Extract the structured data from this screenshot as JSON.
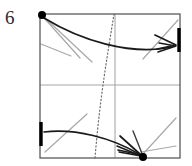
{
  "diagram": {
    "type": "origami-folding-step",
    "step_label": "6",
    "colors": {
      "paper_edge": "#5a5a5a",
      "crease_line": "#a8a8a8",
      "fold_arrow": "#1a1a1a",
      "dotted_fold_line": "#6e6e6e",
      "marker_dot": "#000000",
      "edge_highlight": "#000000",
      "label_text": "#2b2b2b",
      "background": "#ffffff"
    },
    "square": {
      "left": 40,
      "top": 14,
      "right": 180,
      "bottom": 158
    },
    "elements": {
      "square_outline_name": "paper-square-outline",
      "horizontal_crease_name": "horizontal-center-crease",
      "vertical_crease_name": "vertical-center-crease",
      "dotted_curve_name": "dotted-fold-guide-curve",
      "top_arrow_name": "top-fold-arrow",
      "bottom_arrow_name": "bottom-fold-arrow",
      "top_left_dot_name": "top-left-corner-dot",
      "bottom_dot_name": "bottom-edge-target-dot",
      "right_edge_mark_name": "right-edge-thick-mark",
      "left_edge_mark_name": "left-edge-thick-mark"
    },
    "creases": [
      {
        "name": "crease-tl-1",
        "x1": 44,
        "y1": 17,
        "x2": 92,
        "y2": 62
      },
      {
        "name": "crease-tl-2",
        "x1": 45,
        "y1": 19,
        "x2": 80,
        "y2": 58
      },
      {
        "name": "crease-tl-3",
        "x1": 41,
        "y1": 44,
        "x2": 71,
        "y2": 56
      },
      {
        "name": "crease-tr-1",
        "x1": 143,
        "y1": 59,
        "x2": 178,
        "y2": 20
      },
      {
        "name": "crease-bl-1",
        "x1": 45,
        "y1": 152,
        "x2": 87,
        "y2": 114
      },
      {
        "name": "crease-br-1",
        "x1": 143,
        "y1": 154,
        "x2": 176,
        "y2": 118
      },
      {
        "name": "crease-br-2",
        "x1": 141,
        "y1": 152,
        "x2": 176,
        "y2": 146
      }
    ],
    "marks": {
      "right_edge_mark": {
        "x": 179,
        "y1": 28,
        "y2": 52
      },
      "left_edge_mark": {
        "x": 41,
        "y1": 122,
        "y2": 146
      },
      "top_left_dot": {
        "cx": 42,
        "cy": 15,
        "r": 4
      },
      "bottom_dot": {
        "cx": 143,
        "cy": 157,
        "r": 4
      }
    }
  }
}
